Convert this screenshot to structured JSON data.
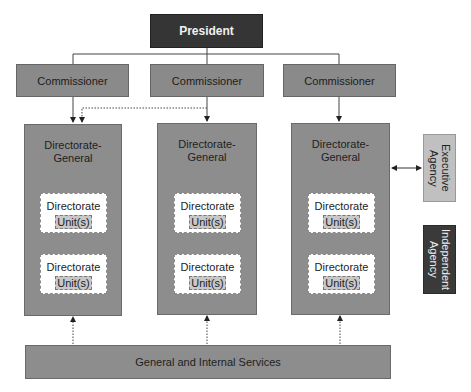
{
  "diagram": {
    "president": {
      "label": "President"
    },
    "commissioners": [
      {
        "label": "Commissioner"
      },
      {
        "label": "Commissioner"
      },
      {
        "label": "Commissioner"
      }
    ],
    "directorates_general": [
      {
        "title": "Directorate-\nGeneral",
        "title_line1": "Directorate-",
        "title_line2": "General",
        "directorates": [
          {
            "label": "Directorate",
            "unit": "Unit(s)"
          },
          {
            "label": "Directorate",
            "unit": "Unit(s)"
          }
        ]
      },
      {
        "title_line1": "Directorate-",
        "title_line2": "General",
        "directorates": [
          {
            "label": "Directorate",
            "unit": "Unit(s)"
          },
          {
            "label": "Directorate",
            "unit": "Unit(s)"
          }
        ]
      },
      {
        "title_line1": "Directorate-",
        "title_line2": "General",
        "directorates": [
          {
            "label": "Directorate",
            "unit": "Unit(s)"
          },
          {
            "label": "Directorate",
            "unit": "Unit(s)"
          }
        ]
      }
    ],
    "agencies": [
      {
        "label": "Executive Agency",
        "line1": "Executive",
        "line2": "Agency"
      },
      {
        "label": "Independent Agency",
        "line1": "Independent",
        "line2": "Agency"
      }
    ],
    "services": {
      "label": "General and Internal Services"
    },
    "colors": {
      "president": "#353535",
      "commissioner": "#8a8a8a",
      "directorate_general": "#8d8d8d",
      "directorate": "#ffffff",
      "unit": "#c8c8c8",
      "executive_agency": "#c0c0c0",
      "independent_agency": "#3a3a3a"
    }
  }
}
